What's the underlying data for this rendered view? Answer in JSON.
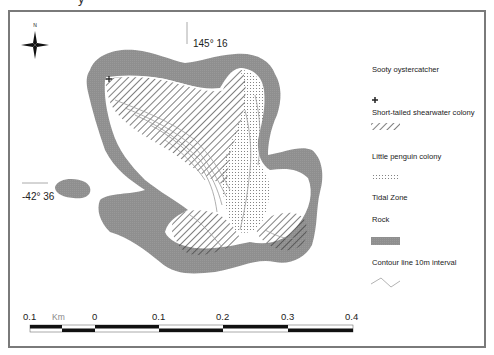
{
  "title_fragment": "y",
  "map": {
    "north_arrow_label": "N",
    "longitude_label": "145° 16",
    "latitude_label": "-42° 36",
    "colors": {
      "rock": "#8f8f8f",
      "frame": "#7a7a7a",
      "hatch": "#3a3a3a",
      "dots": "#6e6e6e",
      "contour": "#9a9a9a"
    }
  },
  "legend": {
    "items": [
      {
        "label": "Sooty oystercatcher",
        "symbol": "cross"
      },
      {
        "label": "Short-tailed shearwater colony",
        "symbol": "hatch"
      },
      {
        "label": "Little penguin colony",
        "symbol": "dots"
      },
      {
        "label": "Tidal Zone",
        "symbol": "none"
      },
      {
        "label": "Rock",
        "symbol": "grey-fill"
      },
      {
        "label": "Contour line 10m interval",
        "symbol": "line"
      }
    ]
  },
  "scale_bar": {
    "unit": "Km",
    "ticks": [
      "0.1",
      "0",
      "0.1",
      "0.2",
      "0.3",
      "0.4"
    ]
  }
}
